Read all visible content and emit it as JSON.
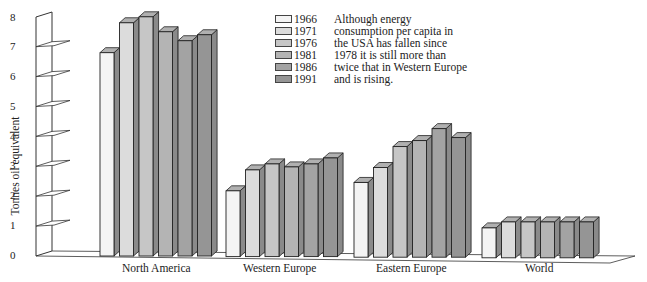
{
  "chart_data": {
    "type": "bar",
    "style": "3d-grouped",
    "title": "",
    "xlabel": "",
    "ylabel": "Tonnes oil equivalent",
    "ylim": [
      0,
      8
    ],
    "yticks": [
      "0",
      "1",
      "2",
      "3",
      "4",
      "5",
      "6",
      "7",
      "8"
    ],
    "grid": false,
    "legend_position": "top-center",
    "categories": [
      "North America",
      "Western Europe",
      "Eastern Europe",
      "World"
    ],
    "series": [
      {
        "name": "1966",
        "color": "#f4f4f4",
        "values": [
          6.8,
          2.2,
          2.5,
          1.0
        ]
      },
      {
        "name": "1971",
        "color": "#dcdcdc",
        "values": [
          7.8,
          2.9,
          3.0,
          1.2
        ]
      },
      {
        "name": "1976",
        "color": "#c6c6c6",
        "values": [
          8.0,
          3.1,
          3.7,
          1.2
        ]
      },
      {
        "name": "1981",
        "color": "#b4b4b4",
        "values": [
          7.5,
          3.0,
          3.9,
          1.2
        ]
      },
      {
        "name": "1986",
        "color": "#a3a3a3",
        "values": [
          7.2,
          3.1,
          4.3,
          1.2
        ]
      },
      {
        "name": "1991",
        "color": "#959595",
        "values": [
          7.4,
          3.3,
          4.0,
          1.2
        ]
      }
    ],
    "annotation": [
      "Although energy",
      "consumption per capita in",
      "the USA has fallen since",
      "1978 it is still more than",
      "twice that in Western Europe",
      "and is rising."
    ]
  }
}
